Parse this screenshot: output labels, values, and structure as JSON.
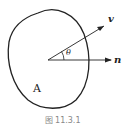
{
  "diagram": {
    "region_label": "A",
    "vector_v_label": "v",
    "vector_n_label": "n",
    "angle_label": "θ",
    "caption": "图 11.3.1"
  }
}
